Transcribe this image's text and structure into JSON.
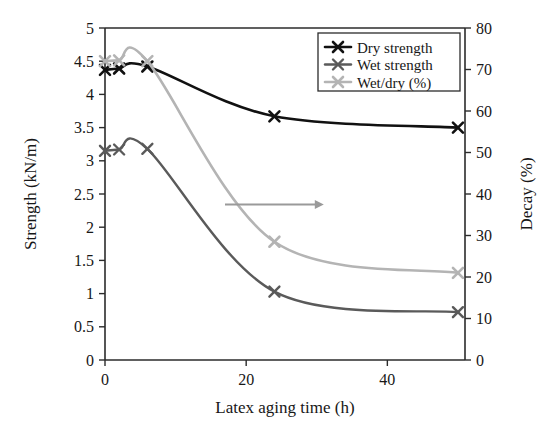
{
  "chart_data": {
    "type": "line",
    "title": "",
    "xlabel": "Latex aging time (h)",
    "ylabel": "Strength (kN/m)",
    "y2label": "Decay (%)",
    "xlim": [
      0,
      51
    ],
    "ylim": [
      0,
      5
    ],
    "y2lim": [
      0,
      80
    ],
    "xticks": [
      0,
      20,
      40
    ],
    "xtick_labels": [
      "0",
      "20",
      "40"
    ],
    "yticks": [
      0,
      0.5,
      1,
      1.5,
      2,
      2.5,
      3,
      3.5,
      4,
      4.5,
      5
    ],
    "ytick_labels": [
      "0",
      "0.5",
      "1",
      "1.5",
      "2",
      "2.5",
      "3",
      "3.5",
      "4",
      "4.5",
      "5"
    ],
    "y2ticks": [
      0,
      10,
      20,
      30,
      40,
      50,
      60,
      70,
      80
    ],
    "y2tick_labels": [
      "0",
      "10",
      "20",
      "30",
      "40",
      "50",
      "60",
      "70",
      "80"
    ],
    "grid": false,
    "legend_position": "top-right",
    "x": [
      0,
      2,
      6,
      24,
      50
    ],
    "series": [
      {
        "name": "Dry strength",
        "axis": "left",
        "color": "#111111",
        "marker": "x",
        "width": 2.6,
        "values": [
          4.37,
          4.39,
          4.42,
          3.67,
          3.5
        ]
      },
      {
        "name": "Wet strength",
        "axis": "left",
        "color": "#5a5a5a",
        "marker": "x",
        "width": 2.4,
        "values": [
          3.15,
          3.17,
          3.18,
          1.03,
          0.72
        ]
      },
      {
        "name": "Wet/dry (%)",
        "axis": "right",
        "color": "#b4b4b4",
        "marker": "x",
        "width": 2.6,
        "values": [
          72.0,
          72.2,
          72.0,
          28.5,
          21.0
        ]
      }
    ],
    "annotations": [
      {
        "type": "arrow",
        "label": "right-axis-pointer",
        "description": "horizontal arrow pointing to right axis",
        "x_start": 17,
        "x_end": 31,
        "y_value": 37.5,
        "axis": "right",
        "color": "#9a9a9a"
      }
    ]
  },
  "legend": {
    "entries": [
      {
        "label": "Dry strength"
      },
      {
        "label": "Wet strength"
      },
      {
        "label": "Wet/dry (%)"
      }
    ]
  }
}
